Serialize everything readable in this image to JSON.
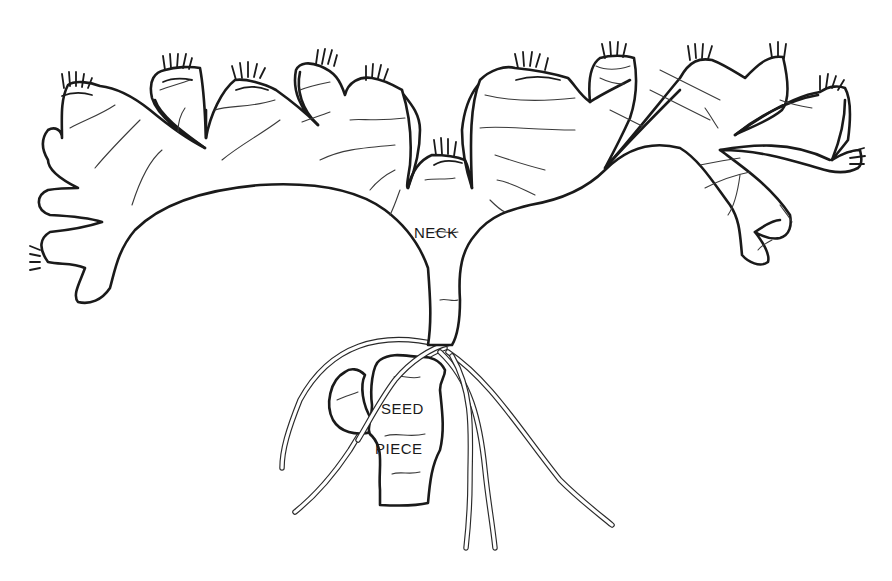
{
  "diagram": {
    "labels": {
      "neck": "NECK",
      "seed": "SEED",
      "piece": "PIECE"
    },
    "colors": {
      "line": "#1a1a1a",
      "background": "#ffffff"
    }
  }
}
